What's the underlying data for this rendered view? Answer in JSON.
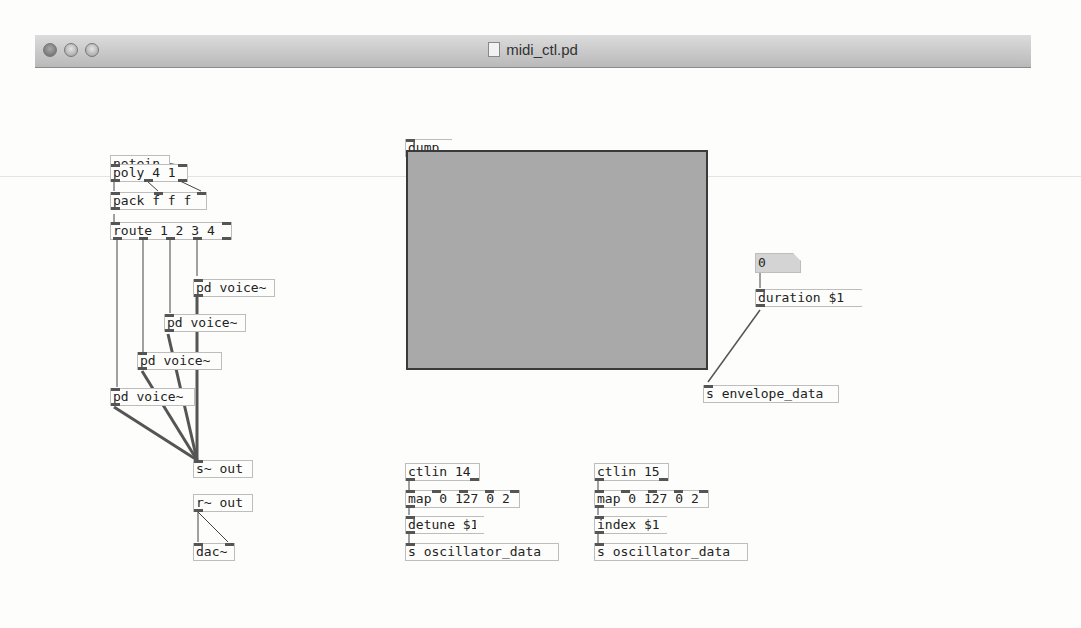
{
  "window": {
    "title": "midi_ctl.pd",
    "controls": [
      "close",
      "minimize",
      "zoom"
    ]
  },
  "objects": {
    "notein": "notein",
    "poly": "poly 4 1",
    "pack": "pack f f f",
    "route": "route 1 2 3 4",
    "voice1": "pd voice~",
    "voice2": "pd voice~",
    "voice3": "pd voice~",
    "voice4": "pd voice~",
    "send_out": "s~ out",
    "recv_out": "r~ out",
    "dac": "dac~",
    "ctlin14": "ctlin 14",
    "map1": "map 0 127 0 2",
    "send_osc1": "s oscillator_data",
    "ctlin15": "ctlin 15",
    "map2": "map 0 127 0 2",
    "send_osc2": "s oscillator_data",
    "send_env": "s envelope_data"
  },
  "messages": {
    "dump": "dump",
    "duration": "duration $1",
    "detune": "detune $1",
    "index": "index $1"
  },
  "number_box": {
    "value": "0"
  },
  "envelope_array": {
    "points": [
      [
        0,
        0
      ],
      [
        0.49,
        1
      ],
      [
        1,
        0
      ]
    ],
    "fill_color": "#a9a9a9",
    "line_color": "#3a3a3a"
  }
}
